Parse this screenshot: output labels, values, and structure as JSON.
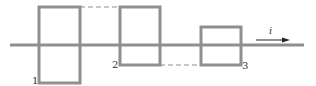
{
  "diagram": {
    "type": "square-wave-current-path",
    "colors": {
      "line": "#8f8f8f",
      "dashed": "#8f8f8f",
      "arrow": "#222222",
      "text": "#333333",
      "background": "#ffffff"
    },
    "axis": {
      "x1": 10,
      "x2": 304,
      "y": 45
    },
    "loops": [
      {
        "id": 1,
        "label": "1",
        "x1": 39,
        "x2": 80,
        "top": 7,
        "bottom": 83,
        "label_x": 32,
        "label_y": 84
      },
      {
        "id": 2,
        "label": "2",
        "x1": 120,
        "x2": 160,
        "top": 7,
        "bottom": 65,
        "label_x": 112,
        "label_y": 68
      },
      {
        "id": 3,
        "label": "3",
        "x1": 201,
        "x2": 241,
        "top": 27,
        "bottom": 65,
        "label_x": 242,
        "label_y": 69
      }
    ],
    "dashed_links": [
      {
        "x1": 80,
        "x2": 120,
        "y": 7
      },
      {
        "x1": 160,
        "x2": 201,
        "y": 65
      }
    ],
    "current_arrow": {
      "label": "i",
      "x1": 256,
      "x2": 290,
      "y": 40,
      "label_x": 269,
      "label_y": 34
    }
  }
}
